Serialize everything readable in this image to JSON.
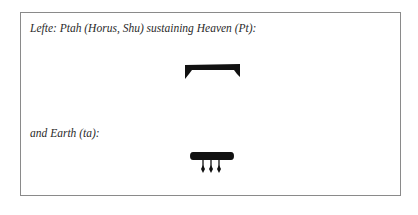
{
  "figure": {
    "captions": [
      "Lefte: Ptah (Horus, Shu) sustaining Heaven (Pt):",
      "and Earth (ta):"
    ],
    "glyphs": [
      {
        "name": "heaven-hieroglyph",
        "meaning": "Heaven (Pt)"
      },
      {
        "name": "earth-hieroglyph",
        "meaning": "Earth (ta)"
      }
    ],
    "ink_color": "#111111"
  }
}
